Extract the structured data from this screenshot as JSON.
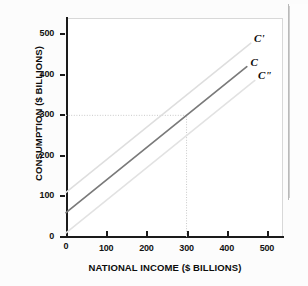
{
  "chart_data": {
    "type": "line",
    "title": "",
    "xlabel": "NATIONAL INCOME ($ BILLIONS)",
    "ylabel": "CONSUMPTION ($ BILLIONS)",
    "xlim": [
      0,
      540
    ],
    "ylim": [
      0,
      540
    ],
    "xticks": [
      0,
      100,
      200,
      300,
      400,
      500
    ],
    "yticks": [
      0,
      100,
      200,
      300,
      400,
      500
    ],
    "xtick_labels": [
      "0",
      "100",
      "200",
      "300",
      "400",
      "500"
    ],
    "ytick_labels": [
      "0",
      "100",
      "200",
      "300",
      "400",
      "500"
    ],
    "grid": false,
    "legend_position": "inline-end-labels",
    "series": [
      {
        "name": "C'",
        "label": "C'",
        "color": "#dedede",
        "intercept": 110,
        "slope": 0.8,
        "x": [
          0,
          460
        ],
        "values": [
          110,
          478
        ],
        "label_x": 468,
        "label_y": 487
      },
      {
        "name": "C",
        "label": "C",
        "color": "#7a7a7a",
        "intercept": 60,
        "slope": 0.8,
        "x": [
          0,
          450
        ],
        "values": [
          60,
          420
        ],
        "label_x": 459,
        "label_y": 428
      },
      {
        "name": "C\"",
        "label": "C\"",
        "color": "#e2e2e2",
        "intercept": 10,
        "slope": 0.8,
        "x": [
          0,
          470
        ],
        "values": [
          10,
          386
        ],
        "label_x": 478,
        "label_y": 396
      }
    ],
    "reference_lines": [
      {
        "name": "equilibrium-horizontal",
        "orientation": "horizontal",
        "value": 300,
        "from": 0,
        "to": 300,
        "style": "dotted",
        "color": "#c9c9c9"
      },
      {
        "name": "equilibrium-vertical",
        "orientation": "vertical",
        "value": 300,
        "from": 0,
        "to": 300,
        "style": "dotted",
        "color": "#c9c9c9"
      }
    ],
    "annotations": [
      {
        "name": "equilibrium-point",
        "x": 300,
        "y": 300,
        "label": ""
      }
    ]
  },
  "axes": {
    "y_title": "CONSUMPTION ($ BILLIONS)",
    "x_title": "NATIONAL INCOME ($ BILLIONS)",
    "y_ticks": [
      "500",
      "400",
      "300",
      "200",
      "100",
      "0"
    ],
    "x_ticks": [
      "0",
      "100",
      "200",
      "300",
      "400",
      "500"
    ]
  },
  "curve_labels": {
    "upper": "C'",
    "middle": "C",
    "lower": "C\""
  }
}
